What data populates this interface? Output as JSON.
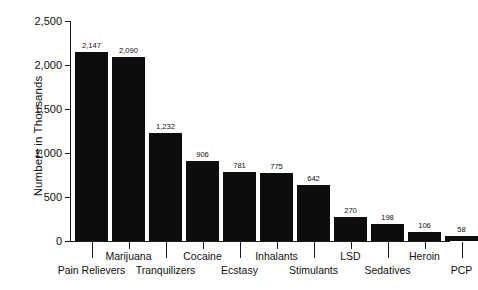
{
  "chart_data": {
    "type": "bar",
    "title": "",
    "xlabel": "",
    "ylabel": "Numbers in Thousands",
    "ylim": [
      0,
      2500
    ],
    "ytick_values": [
      0,
      500,
      1000,
      1500,
      2000,
      2500
    ],
    "ytick_labels": [
      "0",
      "500",
      "1,000",
      "1,500",
      "2,000",
      "2,500"
    ],
    "grid": false,
    "legend": false,
    "orientation": "vertical",
    "bar_color": "#0d0d0d",
    "categories": [
      "Pain Relievers",
      "Marijuana",
      "Tranquilizers",
      "Cocaine",
      "Ecstasy",
      "Inhalants",
      "Stimulants",
      "LSD",
      "Sedatives",
      "Heroin",
      "PCP"
    ],
    "values": [
      2147,
      2090,
      1232,
      906,
      781,
      775,
      642,
      270,
      198,
      106,
      58
    ],
    "value_labels": [
      "2,147",
      "2,090",
      "1,232",
      "906",
      "781",
      "775",
      "642",
      "270",
      "198",
      "106",
      "58"
    ],
    "label_rows": [
      "lower",
      "upper",
      "lower",
      "upper",
      "lower",
      "upper",
      "lower",
      "upper",
      "lower",
      "upper",
      "lower"
    ]
  }
}
